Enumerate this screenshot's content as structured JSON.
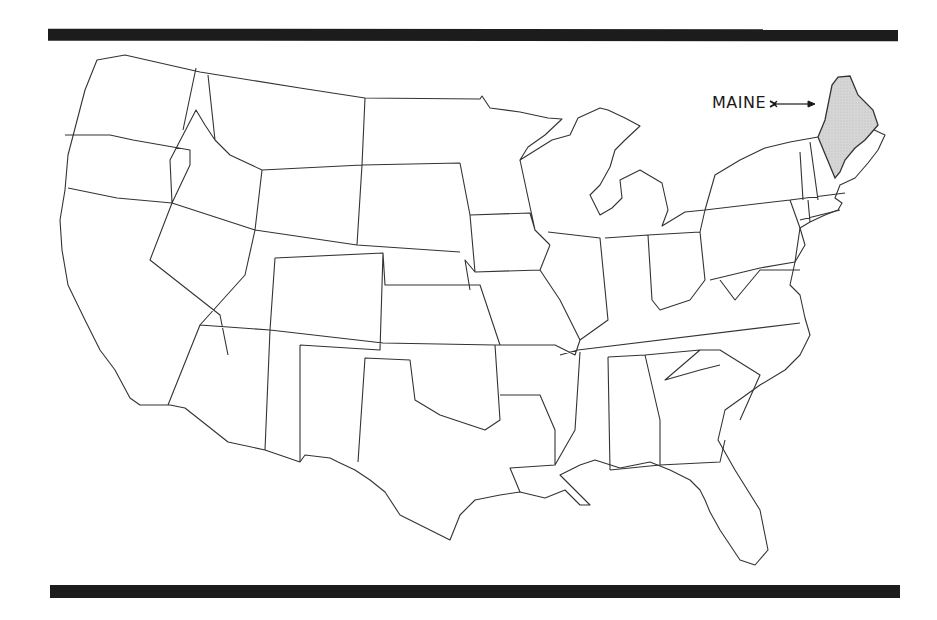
{
  "map": {
    "title": "Contiguous United States",
    "highlighted_state": "Maine",
    "highlight_color": "#d6d6d6",
    "outline_color": "#333333",
    "callout": {
      "label": "MAINE",
      "arrow": "right-arrow"
    }
  },
  "decor": {
    "top_bar_color": "#1c1c1c",
    "bottom_bar_color": "#1c1c1c"
  }
}
